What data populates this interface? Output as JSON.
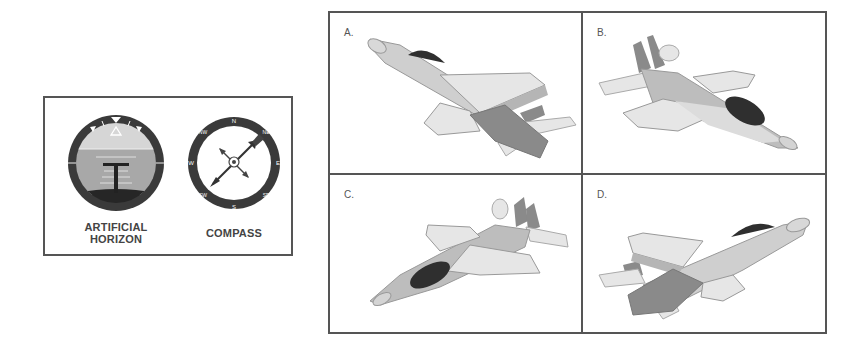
{
  "instruments": {
    "artificial_horizon": {
      "label_line1": "ARTIFICIAL",
      "label_line2": "HORIZON"
    },
    "compass": {
      "label": "COMPASS",
      "cardinals": [
        "N",
        "E",
        "S",
        "W"
      ],
      "intercardinals": [
        "NE",
        "SE",
        "SW",
        "NW"
      ],
      "needle_direction": "NE"
    }
  },
  "options": [
    {
      "label": "A.",
      "orientation": "nose up-left, banked, underside visible"
    },
    {
      "label": "B.",
      "orientation": "nose down-right, topside visible"
    },
    {
      "label": "C.",
      "orientation": "nose down-left, topside visible"
    },
    {
      "label": "D.",
      "orientation": "nose up-right, banked, underside visible"
    }
  ],
  "colors": {
    "border": "#555555",
    "gauge_ring": "#3a3a3a",
    "sky": "#c8c8c8",
    "ground": "#2e2e2e",
    "plane_light": "#e6e6e6",
    "plane_mid": "#bdbdbd",
    "plane_dark": "#8a8a8a",
    "canopy": "#2f2f2f"
  }
}
